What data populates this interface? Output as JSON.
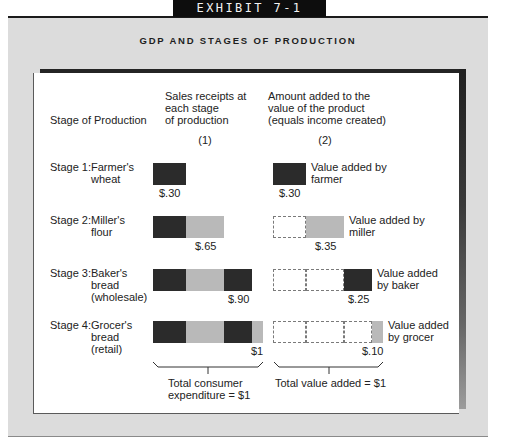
{
  "exhibit": {
    "label": "EXHIBIT 7-1"
  },
  "title": "GDP AND STAGES OF PRODUCTION",
  "headers": {
    "stage": "Stage of Production",
    "col1": {
      "lines": [
        "Sales receipts at",
        "each stage",
        "of production"
      ],
      "number": "(1)"
    },
    "col2": {
      "lines": [
        "Amount added to the",
        "value of the product",
        "(equals income created)"
      ],
      "number": "(2)"
    }
  },
  "colors": {
    "dark": "#2b2b2b",
    "light": "#b9b9b9",
    "panel": "#dcdcdc"
  },
  "stages": [
    {
      "prefix": "Stage 1:",
      "lines": [
        "Farmer's",
        "wheat"
      ],
      "tone": "dark",
      "value_added": 0.3,
      "sales_receipts": 0.3,
      "sales_label": "$.30",
      "value_added_label": "$.30",
      "caption": [
        "Value added by",
        "farmer"
      ]
    },
    {
      "prefix": "Stage 2:",
      "lines": [
        "Miller's",
        "flour"
      ],
      "tone": "light",
      "value_added": 0.35,
      "sales_receipts": 0.65,
      "sales_label": "$.65",
      "value_added_label": "$.35",
      "caption": [
        "Value added by",
        "miller"
      ]
    },
    {
      "prefix": "Stage 3:",
      "lines": [
        "Baker's",
        "bread",
        "(wholesale)"
      ],
      "tone": "dark",
      "value_added": 0.25,
      "sales_receipts": 0.9,
      "sales_label": "$.90",
      "value_added_label": "$.25",
      "caption": [
        "Value added",
        "by baker"
      ]
    },
    {
      "prefix": "Stage 4:",
      "lines": [
        "Grocer's",
        "bread",
        "(retail)"
      ],
      "tone": "light",
      "value_added": 0.1,
      "sales_receipts": 1.0,
      "sales_label": "$1",
      "value_added_label": "$.10",
      "caption": [
        "Value added",
        "by grocer"
      ]
    }
  ],
  "totals": {
    "col1": [
      "Total consumer",
      "expenditure = $1"
    ],
    "col2": [
      "Total value added = $1"
    ]
  }
}
